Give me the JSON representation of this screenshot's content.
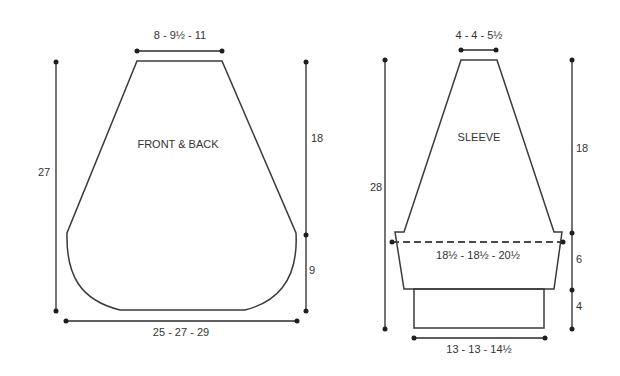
{
  "front_back": {
    "title": "FRONT & BACK",
    "top_width": "8 - 9½ - 11",
    "total_length": "27",
    "armhole_depth": "18",
    "lower_height": "9",
    "bottom_width": "25 - 27 - 29"
  },
  "sleeve": {
    "title": "SLEEVE",
    "top_width": "4 - 4 - 5½",
    "total_length": "28",
    "upper_length": "18",
    "middle_height": "6",
    "cuff_height": "4",
    "upper_arm_width": "18½ - 18½ - 20½",
    "cuff_width": "13 - 13 - 14½"
  },
  "colors": {
    "line": "#3a3a3a",
    "background": "#ffffff"
  }
}
